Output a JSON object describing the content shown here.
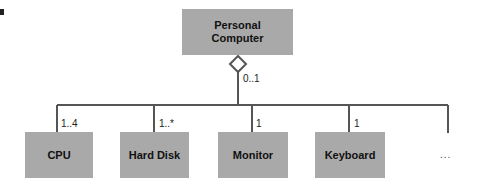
{
  "diagram": {
    "parent": {
      "label": "Personal Computer",
      "line1": "Personal",
      "line2": "Computer",
      "multiplicity": "0..1"
    },
    "children": [
      {
        "label": "CPU",
        "multiplicity": "1..4"
      },
      {
        "label": "Hard Disk",
        "multiplicity": "1..*"
      },
      {
        "label": "Monitor",
        "multiplicity": "1"
      },
      {
        "label": "Keyboard",
        "multiplicity": "1"
      }
    ],
    "more": "...",
    "relationship": "aggregation",
    "colors": {
      "box_fill": "#a9a9a9",
      "line": "#555555"
    }
  }
}
